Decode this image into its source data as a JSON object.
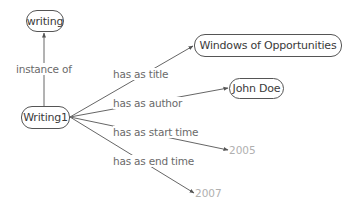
{
  "diagram": {
    "type": "knowledge-graph",
    "nodes": {
      "writing": {
        "label": "writing",
        "kind": "class"
      },
      "writing1": {
        "label": "Writing1",
        "kind": "instance"
      },
      "title": {
        "label": "Windows of Opportunities",
        "kind": "entity"
      },
      "author": {
        "label": "John Doe",
        "kind": "entity"
      },
      "start": {
        "label": "2005",
        "kind": "literal"
      },
      "end": {
        "label": "2007",
        "kind": "literal"
      }
    },
    "edges": [
      {
        "from": "writing1",
        "to": "writing",
        "label": "instance of"
      },
      {
        "from": "writing1",
        "to": "title",
        "label": "has as title"
      },
      {
        "from": "writing1",
        "to": "author",
        "label": "has as author"
      },
      {
        "from": "writing1",
        "to": "start",
        "label": "has as start time"
      },
      {
        "from": "writing1",
        "to": "end",
        "label": "has as end time"
      }
    ],
    "colors": {
      "node_border": "#555555",
      "node_text": "#3a3a3a",
      "edge_line": "#555555",
      "edge_label": "#6a6a6a",
      "literal_text": "#b0b0b0"
    }
  }
}
